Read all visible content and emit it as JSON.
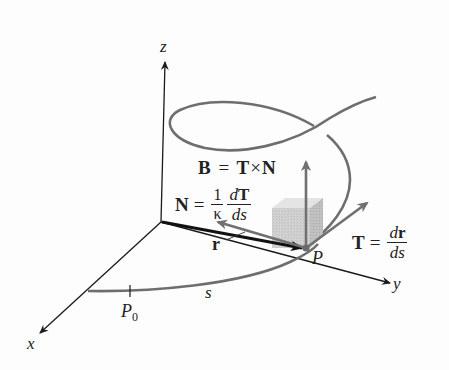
{
  "figure": {
    "axes": {
      "x_label": "x",
      "y_label": "y",
      "z_label": "z"
    },
    "points": {
      "start_point": "P",
      "start_point_sub": "0",
      "moving_point": "P"
    },
    "arc_length_label": "s",
    "position_vector_label": "r",
    "equations": {
      "binormal": {
        "lhs": "B",
        "eq": "=",
        "rhs_a": "T",
        "times": "×",
        "rhs_b": "N"
      },
      "normal": {
        "lhs": "N",
        "eq": "=",
        "frac1_num": "1",
        "frac1_den": "κ",
        "frac2_num_d": "d",
        "frac2_num_v": "T",
        "frac2_den": "ds"
      },
      "tangent": {
        "lhs": "T",
        "eq": "=",
        "frac_num_d": "d",
        "frac_num_v": "r",
        "frac_den": "ds"
      }
    },
    "colors": {
      "axis": "#1a1a1a",
      "curve": "#6e6e6e",
      "frame_vectors": "#707070",
      "position_vector": "#111111",
      "cube": "#cfcfcf",
      "cube_side": "#bdbdbd"
    }
  }
}
